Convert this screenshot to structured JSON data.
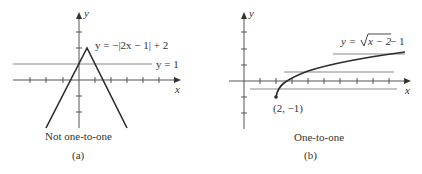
{
  "panels": [
    {
      "label": "(a)",
      "caption": "Not one-to-one",
      "equation": "y = −|2x − 1| + 2",
      "horizontal_line_label": "y = 1",
      "axis_x": "x",
      "axis_y": "y"
    },
    {
      "label": "(b)",
      "caption": "One-to-one",
      "equation_prefix": "y = ",
      "equation_radicand": "x − 2",
      "equation_suffix": " − 1",
      "point_label": "(2, −1)",
      "axis_x": "x",
      "axis_y": "y"
    }
  ],
  "colors": {
    "axis": "#333333",
    "curve": "#2b2b2b",
    "hline": "#8a8a8a",
    "text": "#333333"
  }
}
